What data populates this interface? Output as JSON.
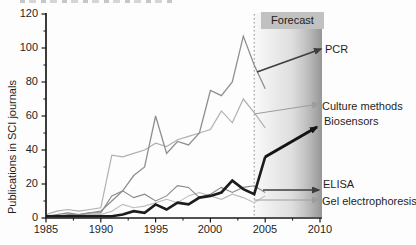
{
  "chart_data": {
    "type": "line",
    "title": "",
    "ylabel": "Publications in SCI journals",
    "xlabel": "",
    "x_ticks": [
      "1985",
      "1990",
      "1995",
      "2000",
      "2005",
      "2010"
    ],
    "y_ticks": [
      "0",
      "20",
      "40",
      "60",
      "80",
      "100",
      "120"
    ],
    "xlim": [
      1985,
      2010.2
    ],
    "ylim": [
      0,
      120
    ],
    "grid": "off",
    "legend_position": "right-side callout labels with arrows",
    "years_start": 1985,
    "series": [
      {
        "name": "Culture methods",
        "color": "#b0b0b0",
        "width": 1.2,
        "values": [
          2,
          4,
          5,
          4,
          5,
          6,
          37,
          36,
          38,
          40,
          44,
          42,
          46,
          48,
          50,
          52,
          63,
          56,
          70,
          62,
          53
        ]
      },
      {
        "name": "Gel electrophoresis",
        "color": "#bcbcbc",
        "width": 1.1,
        "values": [
          1,
          1,
          1,
          2,
          2,
          2,
          4,
          8,
          6,
          7,
          9,
          11,
          9,
          13,
          15,
          13,
          11,
          14,
          12,
          9,
          13
        ]
      },
      {
        "name": "ELISA",
        "color": "#888888",
        "width": 1.1,
        "values": [
          1,
          2,
          3,
          2,
          3,
          3,
          13,
          16,
          12,
          14,
          10,
          13,
          19,
          18,
          12,
          14,
          18,
          15,
          18,
          19,
          15
        ]
      },
      {
        "name": "PCR",
        "color": "#8f8f8f",
        "width": 1.3,
        "values": [
          1,
          1,
          2,
          2,
          3,
          4,
          10,
          16,
          25,
          30,
          60,
          38,
          45,
          43,
          50,
          75,
          72,
          80,
          107,
          90,
          76
        ]
      },
      {
        "name": "Biosensors",
        "color": "#1c1c1c",
        "width": 2.6,
        "values": [
          1,
          1,
          1,
          1,
          1,
          1,
          1,
          2,
          4,
          3,
          8,
          5,
          9,
          8,
          12,
          13,
          15,
          22,
          17,
          14,
          36
        ]
      }
    ],
    "forecast": {
      "label": "Forecast",
      "start_year": 2004,
      "divider_style": "vertical dashed line",
      "band_style": "gray gradient shading, light at left to darker gray at right"
    },
    "arrows": [
      {
        "target": "PCR",
        "x1": 257,
        "y1": 72,
        "x2": 321,
        "y2": 49,
        "color": "#3d3d3d",
        "w": 1.6
      },
      {
        "target": "Culture methods",
        "x1": 254,
        "y1": 114,
        "x2": 319,
        "y2": 104,
        "color": "#9d9d9d",
        "w": 1.2
      },
      {
        "target": "Biosensors",
        "x1": 265,
        "y1": 157,
        "x2": 317,
        "y2": 127,
        "color": "#141414",
        "w": 3.0
      },
      {
        "target": "ELISA",
        "x1": 263,
        "y1": 190,
        "x2": 319,
        "y2": 190,
        "color": "#3d3d3d",
        "w": 1.3
      },
      {
        "target": "Gel electrophoresis",
        "x1": 254,
        "y1": 200,
        "x2": 319,
        "y2": 200,
        "color": "#9d9d9d",
        "w": 1.2
      }
    ],
    "mapping": {
      "x0": 46,
      "year0": 1985,
      "px_per_year": 10.96,
      "y0": 218,
      "px_per_unit": 1.7,
      "top": 13,
      "x_right": 322
    },
    "colors": {
      "axis": "#1a1a1a",
      "dashed_line": "#8a8a8a",
      "band_dark": "#787878",
      "band_light": "#b4b4b4",
      "forecast_box_bg": "#c1c1c1"
    }
  }
}
